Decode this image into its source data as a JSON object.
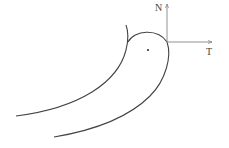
{
  "diagram": {
    "type": "curved-body-with-normal-tangent-axes",
    "axes": {
      "normal": {
        "label": "N"
      },
      "tangent": {
        "label": "T"
      }
    },
    "colors": {
      "stroke": "#444444",
      "axis": "#777777",
      "background": "#ffffff"
    },
    "elements": [
      "left-curve",
      "right-curve",
      "cap-arc",
      "center-dot",
      "normal-axis",
      "tangent-axis"
    ]
  }
}
